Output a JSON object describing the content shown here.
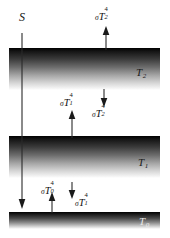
{
  "figure": {
    "background_color": "#ffffff",
    "width": 170,
    "height": 238
  },
  "layers": [
    {
      "id": "t2",
      "name": "upper-atmosphere-layer",
      "temperature_label": "T",
      "temperature_subscript": "2"
    },
    {
      "id": "t1",
      "name": "lower-atmosphere-layer",
      "temperature_label": "T",
      "temperature_subscript": "1"
    },
    {
      "id": "t0",
      "name": "surface-layer",
      "temperature_label": "T",
      "temperature_subscript": "0"
    }
  ],
  "labels": {
    "solar": "S",
    "t2": "T",
    "t2_sub": "2",
    "t1": "T",
    "t1_sub": "1",
    "t0": "T",
    "t0_sub": "0"
  },
  "fluxes": [
    {
      "id": "top-out",
      "name": "outgoing-longwave-top",
      "sigma": "σ",
      "base": "T",
      "exponent": "4",
      "subscript": "2",
      "direction": "up",
      "description": "emission from layer 2 to space"
    },
    {
      "id": "mid-up",
      "name": "upward-flux-layer1",
      "sigma": "σ",
      "base": "T",
      "exponent": "4",
      "subscript": "1",
      "direction": "up",
      "description": "emission from layer 1 upward to layer 2"
    },
    {
      "id": "mid-down",
      "name": "downward-flux-layer2",
      "sigma": "σ",
      "base": "T",
      "exponent": "4",
      "subscript": "2",
      "direction": "down",
      "description": "emission from layer 2 downward to layer 1"
    },
    {
      "id": "low-up",
      "name": "upward-flux-surface",
      "sigma": "σ",
      "base": "T",
      "exponent": "4",
      "subscript": "0",
      "direction": "up",
      "description": "emission from surface upward to layer 1"
    },
    {
      "id": "low-down",
      "name": "downward-flux-layer1",
      "sigma": "σ",
      "base": "T",
      "exponent": "4",
      "subscript": "1",
      "direction": "down",
      "description": "emission from layer 1 downward to surface"
    }
  ],
  "solar_beam": {
    "name": "incoming-solar-beam",
    "label": "S",
    "direction": "down",
    "description": "solar shortwave radiation passing through both layers to the surface"
  },
  "colors": {
    "stroke": "#2a2a2a",
    "arrowhead": "#1a1a1a",
    "layer_dark": "#000000",
    "layer_light": "#ffffff",
    "text": "#111111"
  }
}
